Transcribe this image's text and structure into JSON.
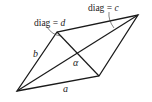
{
  "figure": {
    "type": "parallelogram",
    "vertices": {
      "bottom_left": [
        17,
        91
      ],
      "bottom_right": [
        99,
        76
      ],
      "top_left": [
        57,
        32
      ],
      "top_right": [
        138,
        15
      ]
    },
    "sides": {
      "a": "a",
      "b": "b"
    },
    "diagonals": {
      "c_label": "diag = c",
      "d_label": "diag = d"
    },
    "angle_label": "α",
    "stroke_color": "#1a1a1a"
  },
  "labels": {
    "side_a": "a",
    "side_b": "b",
    "diag_c_prefix": "diag",
    "diag_c_eq": " = ",
    "diag_c_var": "c",
    "diag_d_prefix": "diag",
    "diag_d_eq": " = ",
    "diag_d_var": "d",
    "alpha": "α"
  }
}
